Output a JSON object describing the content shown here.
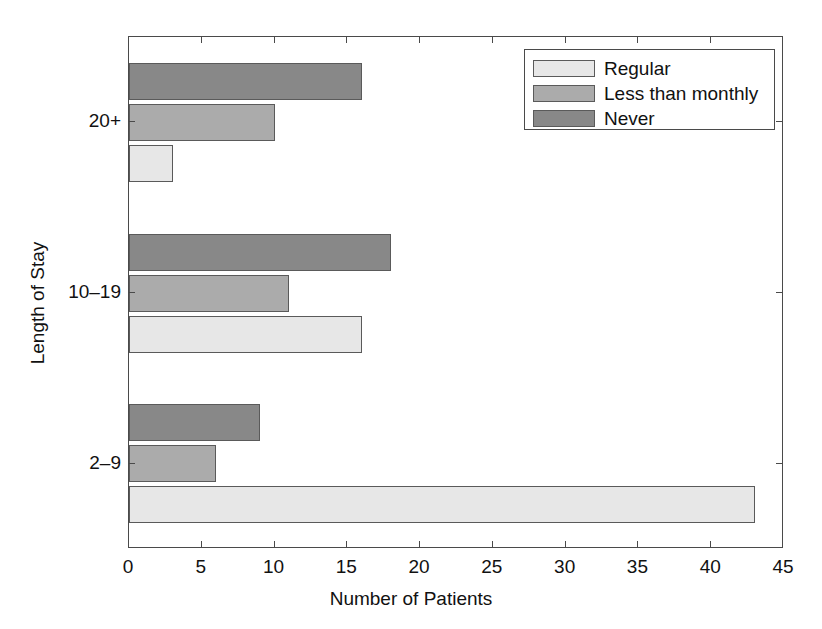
{
  "chart_data": {
    "type": "bar",
    "orientation": "horizontal",
    "title": "",
    "xlabel": "Number of Patients",
    "ylabel": "Length of Stay",
    "categories": [
      "2–9",
      "10–19",
      "20+"
    ],
    "xlim": [
      0,
      45
    ],
    "xticks": [
      0,
      5,
      10,
      15,
      20,
      25,
      30,
      35,
      40,
      45
    ],
    "xtick_labels": [
      "0",
      "5",
      "10",
      "15",
      "20",
      "25",
      "30",
      "35",
      "40",
      "45"
    ],
    "grid": false,
    "legend_position": "top-right",
    "series": [
      {
        "name": "Regular",
        "color": "#e7e7e7",
        "values": [
          43,
          16,
          3
        ]
      },
      {
        "name": "Less than monthly",
        "color": "#ababab",
        "values": [
          6,
          11,
          10
        ]
      },
      {
        "name": "Never",
        "color": "#888888",
        "values": [
          9,
          18,
          16
        ]
      }
    ]
  },
  "legend": {
    "items": [
      {
        "label": "Regular",
        "swatch": "regular"
      },
      {
        "label": "Less than monthly",
        "swatch": "less"
      },
      {
        "label": "Never",
        "swatch": "never"
      }
    ]
  },
  "axes": {
    "x_title": "Number of Patients",
    "y_title": "Length of Stay"
  }
}
